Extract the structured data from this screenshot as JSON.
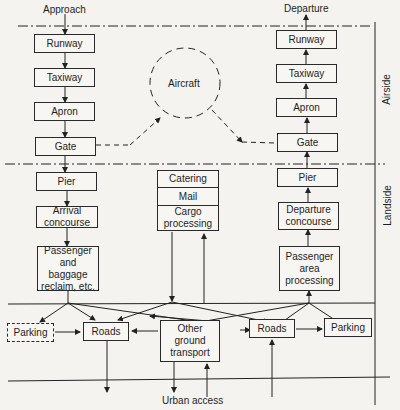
{
  "diagram": {
    "flow_labels": {
      "approach": "Approach",
      "departure": "Departure",
      "urban_access": "Urban access"
    },
    "zones": {
      "airside": "Airside",
      "landside": "Landside"
    },
    "aircraft": "Aircraft",
    "arrival_column": [
      {
        "id": "runway",
        "label": "Runway"
      },
      {
        "id": "taxiway",
        "label": "Taxiway"
      },
      {
        "id": "apron",
        "label": "Apron"
      },
      {
        "id": "gate",
        "label": "Gate"
      },
      {
        "id": "pier",
        "label": "Pier"
      },
      {
        "id": "arrival-concourse",
        "label": "Arrival concourse"
      },
      {
        "id": "baggage-reclaim",
        "label": "Passenger and baggage reclaim, etc."
      }
    ],
    "departure_column": [
      {
        "id": "runway",
        "label": "Runway"
      },
      {
        "id": "taxiway",
        "label": "Taxiway"
      },
      {
        "id": "apron",
        "label": "Apron"
      },
      {
        "id": "gate",
        "label": "Gate"
      },
      {
        "id": "pier",
        "label": "Pier"
      },
      {
        "id": "departure-concourse",
        "label": "Departure concourse"
      },
      {
        "id": "passenger-processing",
        "label": "Passenger area processing"
      }
    ],
    "middle_stack": [
      {
        "id": "catering",
        "label": "Catering"
      },
      {
        "id": "mail",
        "label": "Mail"
      },
      {
        "id": "cargo",
        "label": "Cargo processing"
      }
    ],
    "ground": {
      "parking_left": "Parking",
      "roads_left": "Roads",
      "other_ground": "Other ground transport",
      "roads_right": "Roads",
      "parking_right": "Parking"
    }
  }
}
